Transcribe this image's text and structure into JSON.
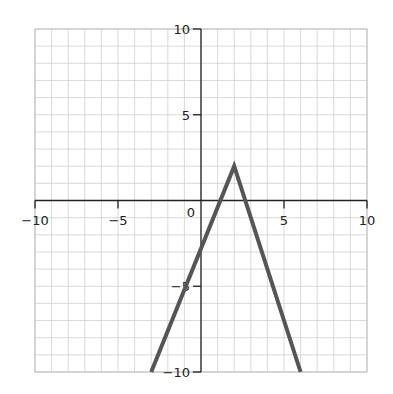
{
  "chart_data": {
    "type": "line",
    "title": "",
    "xlabel": "",
    "ylabel": "",
    "xlim": [
      -10,
      10
    ],
    "ylim": [
      -10,
      10
    ],
    "grid": true,
    "grid_step": 1,
    "x_ticks": [
      -10,
      -5,
      0,
      5,
      10
    ],
    "y_ticks": [
      10,
      5,
      -5,
      -10
    ],
    "x_tick_labels": [
      "−10",
      "−5",
      "0",
      "5",
      "10"
    ],
    "y_tick_labels": [
      "10",
      "5",
      "−5",
      "−10"
    ],
    "origin_label": "0",
    "series": [
      {
        "name": "piecewise linear (inverted V)",
        "x": [
          -3,
          2,
          6
        ],
        "y": [
          -10,
          2,
          -10
        ],
        "color": "#555555"
      }
    ],
    "legend": null
  },
  "colors": {
    "grid": "#cfcfcf",
    "axis": "#222222",
    "line": "#555555"
  }
}
